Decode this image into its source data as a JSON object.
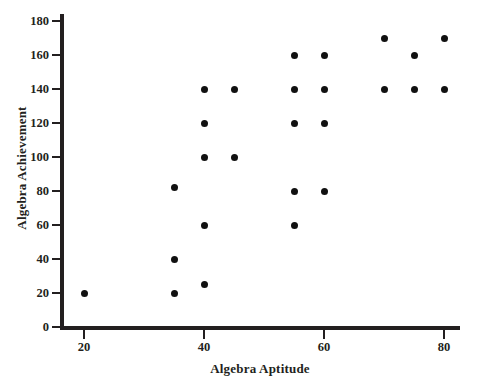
{
  "chart_data": {
    "type": "scatter",
    "title": "",
    "xlabel": "Algebra Aptitude",
    "ylabel": "Algebra Achievement",
    "xlim": [
      14,
      84
    ],
    "ylim": [
      0,
      190
    ],
    "xticks": [
      20,
      40,
      60,
      80
    ],
    "xtick_labels": [
      "20",
      "40",
      "60",
      "80"
    ],
    "yticks": [
      0,
      20,
      40,
      60,
      80,
      100,
      120,
      140,
      160,
      180
    ],
    "ytick_labels": [
      "0",
      "20",
      "40",
      "60",
      "80",
      "100",
      "120",
      "140",
      "160",
      "180"
    ],
    "grid": false,
    "legend": null,
    "marker": "filled-circle",
    "marker_color": "#111111",
    "axis_color": "#231f20",
    "background_color": "#ffffff",
    "points": [
      {
        "x": 20,
        "y": 20
      },
      {
        "x": 35,
        "y": 82
      },
      {
        "x": 35,
        "y": 40
      },
      {
        "x": 35,
        "y": 20
      },
      {
        "x": 40,
        "y": 140
      },
      {
        "x": 40,
        "y": 120
      },
      {
        "x": 40,
        "y": 100
      },
      {
        "x": 40,
        "y": 60
      },
      {
        "x": 40,
        "y": 25
      },
      {
        "x": 45,
        "y": 140
      },
      {
        "x": 45,
        "y": 100
      },
      {
        "x": 55,
        "y": 160
      },
      {
        "x": 55,
        "y": 140
      },
      {
        "x": 55,
        "y": 120
      },
      {
        "x": 55,
        "y": 80
      },
      {
        "x": 55,
        "y": 60
      },
      {
        "x": 60,
        "y": 160
      },
      {
        "x": 60,
        "y": 140
      },
      {
        "x": 60,
        "y": 120
      },
      {
        "x": 60,
        "y": 80
      },
      {
        "x": 70,
        "y": 170
      },
      {
        "x": 70,
        "y": 140
      },
      {
        "x": 75,
        "y": 160
      },
      {
        "x": 75,
        "y": 140
      },
      {
        "x": 80,
        "y": 170
      },
      {
        "x": 80,
        "y": 140
      }
    ]
  }
}
